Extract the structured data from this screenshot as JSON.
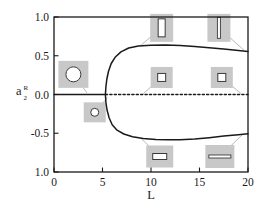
{
  "chart_data": {
    "type": "line",
    "title": "",
    "xlabel": "L",
    "ylabel": "a_2^R",
    "ylabel_base": "a",
    "ylabel_superscript": "R",
    "ylabel_subscript": "2",
    "xlim": [
      0,
      20
    ],
    "ylim": [
      -1.0,
      1.0
    ],
    "xticks": [
      0,
      5,
      10,
      15,
      20
    ],
    "xticklabels": [
      "0",
      "5",
      "10",
      "15",
      "20"
    ],
    "yticks": [
      1.0,
      0.5,
      0.0,
      -0.5,
      -1.0
    ],
    "yticklabels": [
      "1.0",
      "0.5",
      "0.0",
      "-0.5",
      "1.0"
    ],
    "grid": false,
    "legend": "none",
    "bifurcation_point": {
      "x": 5.3,
      "y": 0.0
    },
    "series": [
      {
        "name": "trivial-branch-stable",
        "style": "solid",
        "points": [
          [
            0.0,
            0.0
          ],
          [
            1.0,
            0.0
          ],
          [
            2.0,
            0.0
          ],
          [
            3.0,
            0.0
          ],
          [
            4.0,
            0.0
          ],
          [
            5.0,
            0.0
          ],
          [
            5.3,
            0.0
          ]
        ]
      },
      {
        "name": "trivial-branch-unstable",
        "style": "dotted",
        "points": [
          [
            5.3,
            0.0
          ],
          [
            8.0,
            0.0
          ],
          [
            11.0,
            0.0
          ],
          [
            14.0,
            0.0
          ],
          [
            17.0,
            0.0
          ],
          [
            20.0,
            0.0
          ]
        ]
      },
      {
        "name": "upper-branch",
        "style": "solid",
        "points": [
          [
            5.3,
            0.0
          ],
          [
            5.35,
            0.1
          ],
          [
            5.45,
            0.2
          ],
          [
            5.62,
            0.3
          ],
          [
            5.9,
            0.4
          ],
          [
            6.3,
            0.48
          ],
          [
            6.9,
            0.55
          ],
          [
            7.7,
            0.6
          ],
          [
            8.7,
            0.625
          ],
          [
            10.0,
            0.635
          ],
          [
            11.5,
            0.638
          ],
          [
            13.0,
            0.632
          ],
          [
            14.5,
            0.62
          ],
          [
            16.0,
            0.603
          ],
          [
            17.5,
            0.586
          ],
          [
            19.0,
            0.568
          ],
          [
            20.0,
            0.556
          ]
        ]
      },
      {
        "name": "lower-branch",
        "style": "solid",
        "points": [
          [
            5.3,
            0.0
          ],
          [
            5.35,
            -0.1
          ],
          [
            5.47,
            -0.2
          ],
          [
            5.68,
            -0.3
          ],
          [
            6.0,
            -0.39
          ],
          [
            6.5,
            -0.46
          ],
          [
            7.2,
            -0.51
          ],
          [
            8.1,
            -0.545
          ],
          [
            9.2,
            -0.568
          ],
          [
            10.5,
            -0.58
          ],
          [
            11.8,
            -0.585
          ],
          [
            13.0,
            -0.583
          ],
          [
            14.5,
            -0.573
          ],
          [
            16.0,
            -0.557
          ],
          [
            17.5,
            -0.537
          ],
          [
            19.0,
            -0.518
          ],
          [
            20.0,
            -0.506
          ]
        ]
      }
    ],
    "insets": [
      {
        "id": "inset-circle-large",
        "shape": "circle",
        "anchor_x": 2.0,
        "anchor_y": 0.26,
        "box_w": 30,
        "box_h": 27,
        "glyph_w": 15,
        "glyph_h": 15,
        "leader_to_x": 3.4,
        "leader_to_y": 0.02
      },
      {
        "id": "inset-circle-small",
        "shape": "circle",
        "anchor_x": 4.2,
        "anchor_y": -0.23,
        "box_w": 22,
        "box_h": 20,
        "glyph_w": 8,
        "glyph_h": 8,
        "leader_to_x": 5.5,
        "leader_to_y": -0.04
      },
      {
        "id": "inset-vertical-bar",
        "shape": "vertical-rect",
        "anchor_x": 11.1,
        "anchor_y": 0.86,
        "box_w": 23,
        "box_h": 28,
        "glyph_w": 7,
        "glyph_h": 18,
        "leader_to_x": 9.0,
        "leader_to_y": 0.64
      },
      {
        "id": "inset-vertical-sliver",
        "shape": "vertical-sliver",
        "anchor_x": 17.0,
        "anchor_y": 0.86,
        "box_w": 23,
        "box_h": 28,
        "glyph_w": 3,
        "glyph_h": 21,
        "leader_to_x": 19.6,
        "leader_to_y": 0.57
      },
      {
        "id": "inset-square-mid-left",
        "shape": "square",
        "anchor_x": 11.1,
        "anchor_y": 0.22,
        "box_w": 22,
        "box_h": 21,
        "glyph_w": 8,
        "glyph_h": 8,
        "leader_to_x": 9.2,
        "leader_to_y": 0.01
      },
      {
        "id": "inset-square-mid-right",
        "shape": "square",
        "anchor_x": 17.3,
        "anchor_y": 0.22,
        "box_w": 22,
        "box_h": 21,
        "glyph_w": 8,
        "glyph_h": 8,
        "leader_to_x": 19.3,
        "leader_to_y": 0.01
      },
      {
        "id": "inset-horizontal-bar",
        "shape": "horizontal-rect",
        "anchor_x": 10.9,
        "anchor_y": -0.8,
        "box_w": 27,
        "box_h": 22,
        "glyph_w": 14,
        "glyph_h": 6,
        "leader_to_x": 9.0,
        "leader_to_y": -0.57
      },
      {
        "id": "inset-horizontal-sliver",
        "shape": "horizontal-sliver",
        "anchor_x": 17.1,
        "anchor_y": -0.8,
        "box_w": 29,
        "box_h": 23,
        "glyph_w": 22,
        "glyph_h": 3,
        "leader_to_x": 19.4,
        "leader_to_y": -0.52
      }
    ],
    "colors": {
      "axis": "#1a1a1a",
      "curve": "#1a1a1a",
      "inset_box": "#c8c8c8",
      "inset_glyph_stroke": "#3a3a3a",
      "inset_glyph_fill": "#ffffff",
      "leader": "#8a8a8a",
      "background": "#ffffff"
    }
  }
}
